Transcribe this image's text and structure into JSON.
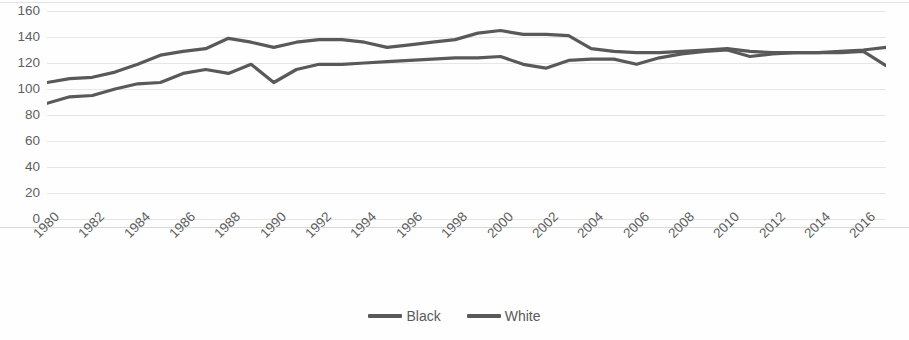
{
  "chart_data": {
    "type": "line",
    "title": "",
    "subtitle": "",
    "xlabel": "",
    "ylabel": "",
    "ylim": [
      0,
      160
    ],
    "ytick_step": 20,
    "yticks": [
      160,
      140,
      120,
      100,
      80,
      60,
      40,
      20,
      0
    ],
    "grid": true,
    "grid_axis": "y",
    "legend_position": "bottom-center",
    "x": [
      1980,
      1981,
      1982,
      1983,
      1984,
      1985,
      1986,
      1987,
      1988,
      1989,
      1990,
      1991,
      1992,
      1993,
      1994,
      1995,
      1996,
      1997,
      1998,
      1999,
      2000,
      2001,
      2002,
      2003,
      2004,
      2005,
      2006,
      2007,
      2008,
      2009,
      2010,
      2011,
      2012,
      2013,
      2014,
      2015,
      2016,
      2017
    ],
    "xtick_labels": [
      "1980",
      "1982",
      "1984",
      "1986",
      "1988",
      "1990",
      "1992",
      "1994",
      "1996",
      "1998",
      "2000",
      "2002",
      "2004",
      "2006",
      "2008",
      "2010",
      "2012",
      "2014",
      "2016"
    ],
    "xlim": [
      1980,
      2017
    ],
    "series": [
      {
        "name": "Black",
        "color": "#595959",
        "values": [
          89,
          94,
          95,
          100,
          104,
          105,
          112,
          115,
          112,
          119,
          105,
          115,
          119,
          119,
          120,
          121,
          122,
          123,
          124,
          124,
          125,
          119,
          116,
          122,
          123,
          123,
          119,
          124,
          127,
          129,
          130,
          125,
          127,
          128,
          128,
          129,
          130,
          132
        ]
      },
      {
        "name": "White",
        "color": "#595959",
        "values": [
          105,
          108,
          109,
          113,
          119,
          126,
          129,
          131,
          139,
          136,
          132,
          136,
          138,
          138,
          136,
          132,
          134,
          136,
          138,
          143,
          145,
          142,
          142,
          141,
          131,
          129,
          128,
          128,
          129,
          130,
          131,
          129,
          128,
          128,
          128,
          128,
          129,
          118
        ]
      }
    ]
  },
  "legend": {
    "items": [
      {
        "label": "Black",
        "color": "#595959"
      },
      {
        "label": "White",
        "color": "#595959"
      }
    ]
  }
}
